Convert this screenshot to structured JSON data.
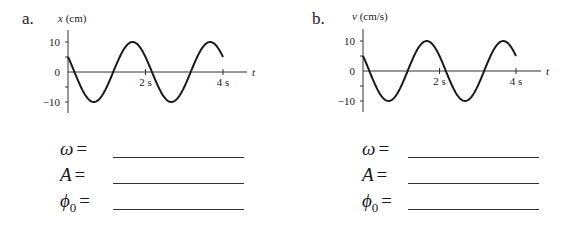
{
  "panels": [
    {
      "part": "a.",
      "ylabel_var": "x",
      "ylabel_unit": "(cm)",
      "xlabel": "t",
      "yticks": [
        "10",
        "0",
        "−10"
      ],
      "xticks": [
        "2 s",
        "4 s"
      ],
      "answers": [
        {
          "symbol": "ω",
          "sub": "",
          "eq": "="
        },
        {
          "symbol": "A",
          "sub": "",
          "eq": "="
        },
        {
          "symbol": "ϕ",
          "sub": "0",
          "eq": "="
        }
      ]
    },
    {
      "part": "b.",
      "ylabel_var": "v",
      "ylabel_unit": "(cm/s)",
      "xlabel": "t",
      "yticks": [
        "10",
        "0",
        "−10"
      ],
      "xticks": [
        "2 s",
        "4 s"
      ],
      "answers": [
        {
          "symbol": "ω",
          "sub": "",
          "eq": "="
        },
        {
          "symbol": "A",
          "sub": "",
          "eq": "="
        },
        {
          "symbol": "ϕ",
          "sub": "0",
          "eq": "="
        }
      ]
    }
  ],
  "chart_data": [
    {
      "type": "line",
      "title": "a.",
      "xlabel": "t",
      "ylabel": "x (cm)",
      "xlim": [
        0,
        4
      ],
      "ylim": [
        -10,
        10
      ],
      "xticks": [
        2,
        4
      ],
      "yticks": [
        -10,
        0,
        10
      ],
      "grid": false,
      "function": "x(t) = 10 cos(pi t + pi/3)",
      "series": [
        {
          "name": "x(t)",
          "x": [
            0,
            0.333,
            0.667,
            1.0,
            1.167,
            1.5,
            1.667,
            2.0,
            2.333,
            2.667,
            3.0,
            3.167,
            3.5,
            3.667,
            4.0
          ],
          "values": [
            5,
            -5,
            -10,
            -5,
            0,
            8.7,
            10,
            5,
            -5,
            -10,
            -5,
            0,
            8.7,
            10,
            5
          ]
        }
      ]
    },
    {
      "type": "line",
      "title": "b.",
      "xlabel": "t",
      "ylabel": "v (cm/s)",
      "xlim": [
        0,
        4
      ],
      "ylim": [
        -10,
        10
      ],
      "xticks": [
        2,
        4
      ],
      "yticks": [
        -10,
        0,
        10
      ],
      "grid": false,
      "function": "v(t) = 10 cos(pi t + pi/3)",
      "series": [
        {
          "name": "v(t)",
          "x": [
            0,
            0.333,
            0.667,
            1.0,
            1.167,
            1.5,
            1.667,
            2.0,
            2.333,
            2.667,
            3.0,
            3.167,
            3.5,
            3.667,
            4.0
          ],
          "values": [
            5,
            -5,
            -10,
            -5,
            0,
            8.7,
            10,
            5,
            -5,
            -10,
            -5,
            0,
            8.7,
            10,
            5
          ]
        }
      ]
    }
  ]
}
